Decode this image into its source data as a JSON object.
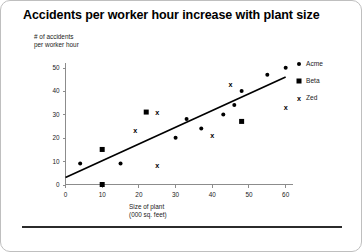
{
  "slide": {
    "title": "Accidents per worker hour increase with plant size"
  },
  "chart_data": {
    "type": "scatter",
    "title": "Accidents per worker hour increase with plant size",
    "xlabel": "Size of plant\n(000 sq. feet)",
    "ylabel": "# of accidents\nper worker hour",
    "xlim": [
      0,
      62
    ],
    "ylim": [
      0,
      52
    ],
    "xticks": [
      0,
      10,
      20,
      30,
      40,
      50,
      60
    ],
    "yticks": [
      0,
      10,
      20,
      30,
      40,
      50
    ],
    "grid": false,
    "legend_position": "right",
    "series": [
      {
        "name": "Acme",
        "marker": "dot",
        "points": [
          [
            4,
            9
          ],
          [
            15,
            9
          ],
          [
            30,
            20
          ],
          [
            33,
            28
          ],
          [
            37,
            24
          ],
          [
            43,
            30
          ],
          [
            46,
            34
          ],
          [
            48,
            40
          ],
          [
            55,
            47
          ],
          [
            60,
            50
          ]
        ]
      },
      {
        "name": "Beta",
        "marker": "square",
        "points": [
          [
            10,
            0
          ],
          [
            10,
            15
          ],
          [
            22,
            31
          ],
          [
            48,
            27
          ]
        ]
      },
      {
        "name": "Zed",
        "marker": "x",
        "points": [
          [
            19,
            23
          ],
          [
            25,
            8
          ],
          [
            25,
            31
          ],
          [
            40,
            21
          ],
          [
            45,
            43
          ],
          [
            60,
            33
          ]
        ]
      }
    ],
    "trendline": {
      "x0": 0,
      "y0": 3,
      "x1": 60,
      "y1": 46
    },
    "legend": [
      {
        "label": "Acme",
        "marker": "dot"
      },
      {
        "label": "Beta",
        "marker": "square"
      },
      {
        "label": "Zed",
        "marker": "x"
      }
    ]
  }
}
